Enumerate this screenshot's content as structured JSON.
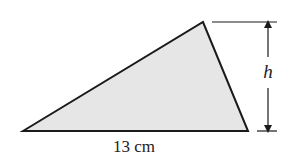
{
  "figure": {
    "shape": "triangle",
    "fill_color": "#e6e6e6",
    "stroke_color": "#1a1a1a",
    "base_label": "13 cm",
    "height_label": "h"
  }
}
